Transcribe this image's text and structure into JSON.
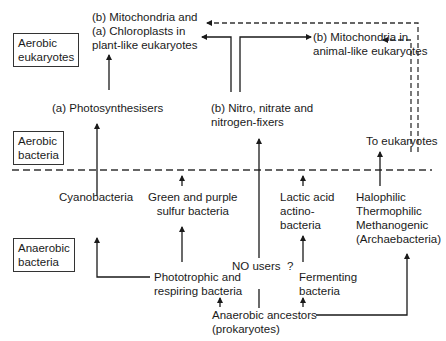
{
  "zones": {
    "aerobic_eukaryotes": "Aerobic\neukaryotes",
    "aerobic_bacteria": "Aerobic\nbacteria",
    "anaerobic_bacteria": "Anaerobic\nbacteria"
  },
  "nodes": {
    "mito_chloro_plant": "(b) Mitochondria and\n(a) Chloroplasts in\nplant-like eukaryotes",
    "mito_animal": "(b) Mitochondria in\nanimal-like eukaryotes",
    "photosynthesisers": "(a) Photosynthesisers",
    "nitro": "(b) Nitro, nitrate and\nnitrogen-fixers",
    "to_eukaryotes": "To eukaryotes",
    "cyanobacteria": "Cyanobacteria",
    "green_purple": "Green and purple\nsulfur bacteria",
    "lactic_acid": "Lactic acid\nactino-\nbacteria",
    "archaea": "Halophilic\nThermophilic\nMethanogenic\n(Archaebacteria)",
    "no_users": "NO users  ?",
    "phototrophic": "Phototrophic and\nrespiring bacteria",
    "fermenting": "Fermenting\nbacteria",
    "ancestors": "Anaerobic ancestors\n(prokaryotes)"
  },
  "colors": {
    "line": "#1a1a1a",
    "dashed": "#333333"
  }
}
